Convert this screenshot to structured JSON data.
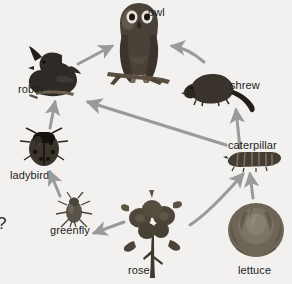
{
  "diagram": {
    "background_color": "#f2f1ef",
    "arrow_color": "#9a9a99",
    "label_color": "#1c1c1c",
    "stray_mark": "?"
  },
  "organisms": [
    {
      "id": "owl",
      "label": "owl",
      "icon": "owl-icon",
      "label_x": 148,
      "label_y": 7,
      "img_x": 108,
      "img_y": 2,
      "img_w": 62,
      "img_h": 82
    },
    {
      "id": "robin",
      "label": "robin",
      "icon": "robin-icon",
      "label_x": 18,
      "label_y": 84,
      "img_x": 25,
      "img_y": 52,
      "img_w": 58,
      "img_h": 45
    },
    {
      "id": "shrew",
      "label": "shrew",
      "icon": "shrew-icon",
      "label_x": 230,
      "label_y": 80,
      "img_x": 192,
      "img_y": 70,
      "img_w": 72,
      "img_h": 36
    },
    {
      "id": "ladybird",
      "label": "ladybird",
      "icon": "ladybird-icon",
      "label_x": 10,
      "label_y": 170,
      "img_x": 22,
      "img_y": 128,
      "img_w": 46,
      "img_h": 42
    },
    {
      "id": "caterpillar",
      "label": "caterpillar",
      "icon": "caterpillar-icon",
      "label_x": 228,
      "label_y": 140,
      "img_x": 225,
      "img_y": 152,
      "img_w": 56,
      "img_h": 17
    },
    {
      "id": "greenfly",
      "label": "greenfly",
      "icon": "greenfly-icon",
      "label_x": 50,
      "label_y": 225,
      "img_x": 56,
      "img_y": 196,
      "img_w": 40,
      "img_h": 32
    },
    {
      "id": "rose",
      "label": "rose",
      "icon": "rose-icon",
      "label_x": 128,
      "label_y": 265,
      "img_x": 124,
      "img_y": 198,
      "img_w": 58,
      "img_h": 82
    },
    {
      "id": "lettuce",
      "label": "lettuce",
      "icon": "lettuce-icon",
      "label_x": 238,
      "label_y": 265,
      "img_x": 228,
      "img_y": 200,
      "img_w": 60,
      "img_h": 60
    }
  ],
  "arrows": [
    {
      "id": "rose-to-greenfly",
      "from": "rose",
      "to": "greenfly",
      "type": "straight",
      "x1": 124,
      "y1": 222,
      "x2": 94,
      "y2": 233
    },
    {
      "id": "greenfly-to-ladybird",
      "from": "greenfly",
      "to": "ladybird",
      "type": "straight",
      "x1": 60,
      "y1": 196,
      "x2": 50,
      "y2": 172
    },
    {
      "id": "ladybird-to-robin",
      "from": "ladybird",
      "to": "robin",
      "type": "straight",
      "x1": 50,
      "y1": 128,
      "x2": 55,
      "y2": 102
    },
    {
      "id": "robin-to-owl",
      "from": "robin",
      "to": "owl",
      "type": "straight",
      "x1": 78,
      "y1": 64,
      "x2": 112,
      "y2": 46
    },
    {
      "id": "shrew-to-owl",
      "from": "shrew",
      "to": "owl",
      "type": "curve",
      "x1": 204,
      "y1": 62,
      "x2": 172,
      "y2": 46,
      "cx": 188,
      "cy": 48
    },
    {
      "id": "caterpillar-to-shrew",
      "from": "caterpillar",
      "to": "shrew",
      "type": "straight",
      "x1": 240,
      "y1": 148,
      "x2": 236,
      "y2": 110
    },
    {
      "id": "caterpillar-to-robin",
      "from": "caterpillar",
      "to": "robin",
      "type": "straight",
      "x1": 226,
      "y1": 145,
      "x2": 88,
      "y2": 102
    },
    {
      "id": "rose-to-caterpillar",
      "from": "rose",
      "to": "caterpillar",
      "type": "curve",
      "x1": 190,
      "y1": 225,
      "x2": 243,
      "y2": 174,
      "cx": 210,
      "cy": 212
    },
    {
      "id": "lettuce-to-caterpillar",
      "from": "lettuce",
      "to": "caterpillar",
      "type": "straight",
      "x1": 253,
      "y1": 198,
      "x2": 250,
      "y2": 174
    }
  ]
}
